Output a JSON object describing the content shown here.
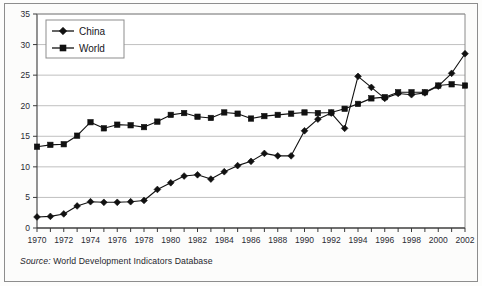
{
  "figure": {
    "source_label": "Source:",
    "source_text": "World Development Indicators Database"
  },
  "legend": {
    "position": "top-left-inside",
    "entries": [
      {
        "label": "China",
        "marker": "diamond",
        "color": "#111111"
      },
      {
        "label": "World",
        "marker": "square",
        "color": "#111111"
      }
    ]
  },
  "chart_data": {
    "type": "line",
    "title": "",
    "subtitle": "",
    "xlabel": "",
    "ylabel": "",
    "xlim": [
      1970,
      2002
    ],
    "ylim": [
      0,
      35
    ],
    "ytick_step": 5,
    "xtick_step": 2,
    "grid": true,
    "grid_axis": "y",
    "legend_position": "upper left",
    "x": [
      1970,
      1971,
      1972,
      1973,
      1974,
      1975,
      1976,
      1977,
      1978,
      1979,
      1980,
      1981,
      1982,
      1983,
      1984,
      1985,
      1986,
      1987,
      1988,
      1989,
      1990,
      1991,
      1992,
      1993,
      1994,
      1995,
      1996,
      1997,
      1998,
      1999,
      2000,
      2001,
      2002
    ],
    "xtick_labels": [
      "1970",
      "1972",
      "1974",
      "1976",
      "1978",
      "1980",
      "1982",
      "1984",
      "1986",
      "1988",
      "1990",
      "1992",
      "1994",
      "1996",
      "1998",
      "2000",
      "2002"
    ],
    "ytick_labels": [
      "0",
      "5",
      "10",
      "15",
      "20",
      "25",
      "30",
      "35"
    ],
    "series": [
      {
        "name": "China",
        "marker": "diamond",
        "color": "#111111",
        "values": [
          1.8,
          1.9,
          2.3,
          3.6,
          4.3,
          4.2,
          4.2,
          4.3,
          4.5,
          6.3,
          7.4,
          8.5,
          8.7,
          8.0,
          9.2,
          10.2,
          10.9,
          12.2,
          11.8,
          11.8,
          15.9,
          17.8,
          18.8,
          16.3,
          24.8,
          23.0,
          21.2,
          22.0,
          21.8,
          22.1,
          23.2,
          25.3,
          28.5
        ]
      },
      {
        "name": "World",
        "marker": "square",
        "color": "#111111",
        "values": [
          13.3,
          13.6,
          13.7,
          15.1,
          17.3,
          16.3,
          16.9,
          16.8,
          16.5,
          17.4,
          18.5,
          18.8,
          18.2,
          18.0,
          18.9,
          18.7,
          17.9,
          18.3,
          18.5,
          18.7,
          18.9,
          18.8,
          18.9,
          19.5,
          20.3,
          21.2,
          21.4,
          22.2,
          22.2,
          22.2,
          23.3,
          23.5,
          23.3
        ]
      }
    ]
  }
}
